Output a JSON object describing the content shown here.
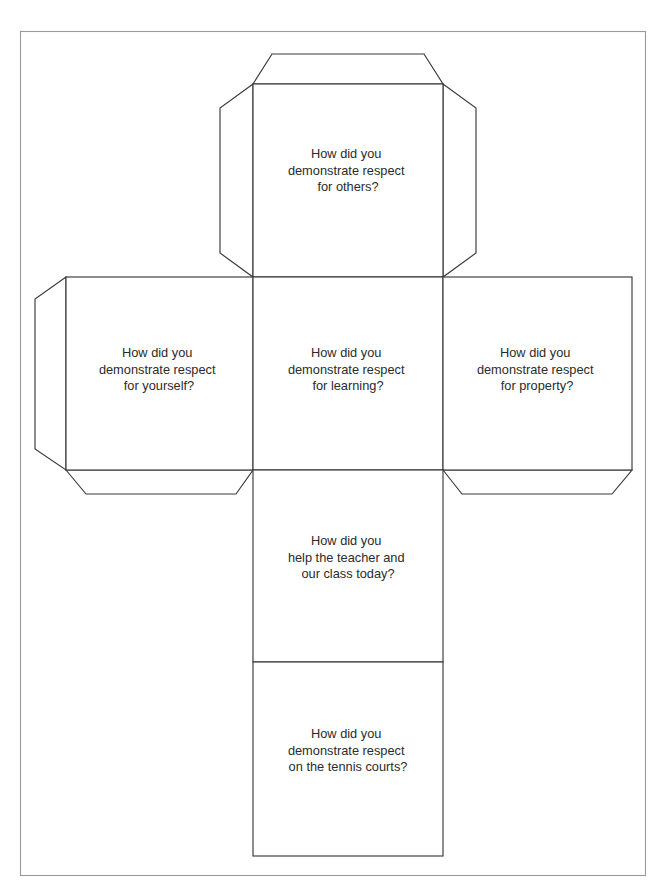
{
  "document": {
    "kind": "cube-net-worksheet",
    "page_background": "#ffffff",
    "border_color": "#9a9a9a",
    "line_color": "#3a3a3a",
    "text_color": "#2b2b2b"
  },
  "panels": {
    "top": {
      "name": "respect-for-others",
      "lines": [
        "How did you",
        "demonstrate respect",
        "for others?"
      ]
    },
    "left": {
      "name": "respect-for-yourself",
      "lines": [
        "How did you",
        "demonstrate respect",
        "for yourself?"
      ]
    },
    "center": {
      "name": "respect-for-learning",
      "lines": [
        "How did you",
        "demonstrate respect",
        "for learning?"
      ]
    },
    "right": {
      "name": "respect-for-property",
      "lines": [
        "How did you",
        "demonstrate respect",
        "for property?"
      ]
    },
    "lower": {
      "name": "help-teacher-and-class",
      "lines": [
        "How did you",
        "help the teacher and",
        "our class today?"
      ]
    },
    "bottom": {
      "name": "respect-on-tennis-courts",
      "lines": [
        "How did you",
        "demonstrate respect",
        "on the tennis courts?"
      ]
    }
  }
}
